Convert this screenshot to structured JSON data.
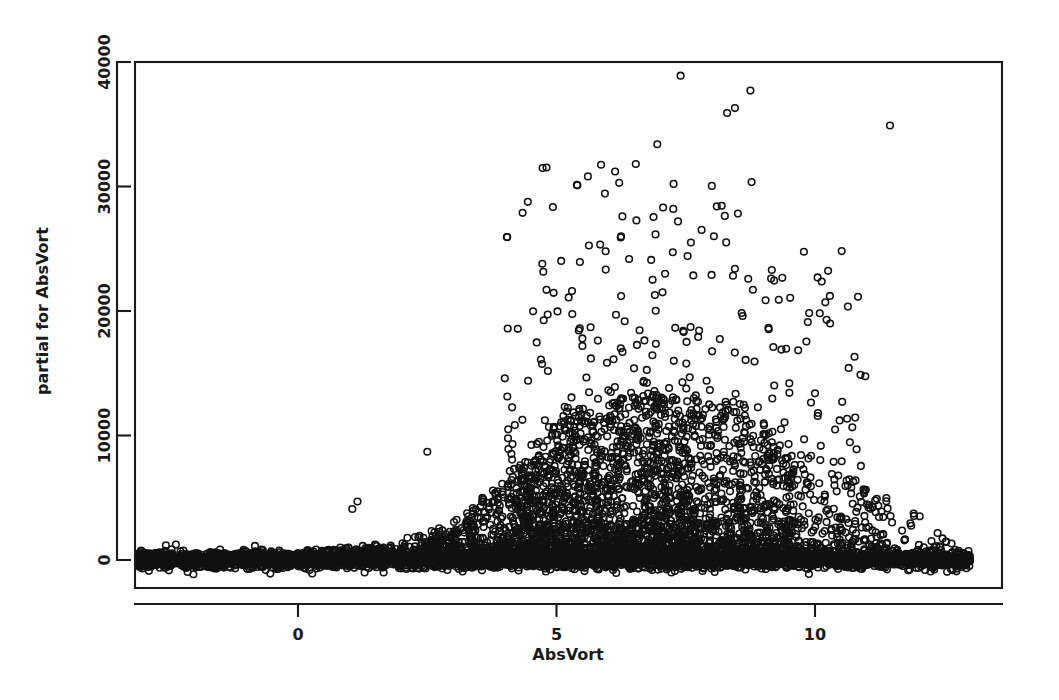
{
  "chart_data": {
    "type": "scatter",
    "title": "",
    "subtitle": "",
    "xlabel": "AbsVort",
    "ylabel": "partial for AbsVort",
    "xlim": [
      -3.2,
      13.3
    ],
    "ylim": [
      -1600,
      40000
    ],
    "xticks": [
      0,
      5,
      10
    ],
    "xtick_labels": [
      "0",
      "5",
      "10"
    ],
    "yticks": [
      0,
      10000,
      20000,
      30000,
      40000
    ],
    "ytick_labels": [
      "0",
      "10000",
      "20000",
      "30000",
      "40000"
    ],
    "grid": false,
    "legend": null,
    "marker": "open-circle",
    "marker_size_px": 6.6,
    "marker_color": "#111111",
    "frame": true,
    "n_points_approx": 9000,
    "notable_points": [
      {
        "x": 7.4,
        "y": 38900
      },
      {
        "x": 8.75,
        "y": 37700
      },
      {
        "x": 8.45,
        "y": 36300
      },
      {
        "x": 8.3,
        "y": 35900
      },
      {
        "x": 11.45,
        "y": 34900
      },
      {
        "x": 6.95,
        "y": 33400
      },
      {
        "x": 8.1,
        "y": 28400
      },
      {
        "x": 7.35,
        "y": 27200
      },
      {
        "x": 6.25,
        "y": 26000
      },
      {
        "x": 7.6,
        "y": 25500
      },
      {
        "x": 5.95,
        "y": 24800
      },
      {
        "x": 8.45,
        "y": 23400
      },
      {
        "x": 7.1,
        "y": 23000
      },
      {
        "x": 8.0,
        "y": 22900
      },
      {
        "x": 9.15,
        "y": 22600
      },
      {
        "x": 10.05,
        "y": 22700
      },
      {
        "x": 5.3,
        "y": 21600
      },
      {
        "x": 6.25,
        "y": 21200
      },
      {
        "x": 7.05,
        "y": 21500
      },
      {
        "x": 9.3,
        "y": 20900
      },
      {
        "x": 10.2,
        "y": 20700
      },
      {
        "x": 6.15,
        "y": 19700
      },
      {
        "x": 8.6,
        "y": 19600
      },
      {
        "x": 5.45,
        "y": 18600
      },
      {
        "x": 7.45,
        "y": 18400
      },
      {
        "x": 5.5,
        "y": 17200
      },
      {
        "x": 9.35,
        "y": 16900
      },
      {
        "x": 6.5,
        "y": 15400
      },
      {
        "x": 4.45,
        "y": 14400
      },
      {
        "x": 2.5,
        "y": 8700
      },
      {
        "x": 1.15,
        "y": 4700
      },
      {
        "x": 1.05,
        "y": 4100
      },
      {
        "x": 12.8,
        "y": 150
      }
    ],
    "baseline_band": {
      "x_start": -3.1,
      "x_end": 13.0,
      "y_center": 0,
      "y_spread": 600,
      "note": "near-continuous dense band of overlapping open circles along y = 0"
    },
    "fan_envelope": {
      "note": "upper envelope of the main dense cloud rises from ~0 at x=-3 to ~13000 near x=6-7 then falls to ~4000 by x=12",
      "x": [
        -3,
        0,
        2,
        3,
        4,
        5,
        6,
        7,
        8,
        9,
        10,
        11,
        12,
        13
      ],
      "upper_y": [
        200,
        700,
        1500,
        3000,
        6500,
        11000,
        13500,
        13000,
        12500,
        11000,
        8000,
        5500,
        4000,
        300
      ]
    }
  }
}
